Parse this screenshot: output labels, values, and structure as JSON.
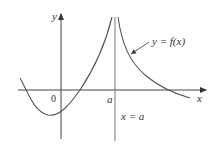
{
  "figure": {
    "type": "function-graph-with-vertical-asymptote",
    "colors": {
      "background": "#ffffff",
      "axes": "#444444",
      "curve": "#555555",
      "asymptote": "#777777",
      "text": "#333333"
    },
    "labels": {
      "y_axis": "y",
      "x_axis": "x",
      "origin": "0",
      "a_tick": "a",
      "asymptote": "x = a",
      "curve": "y = f(x)"
    }
  }
}
